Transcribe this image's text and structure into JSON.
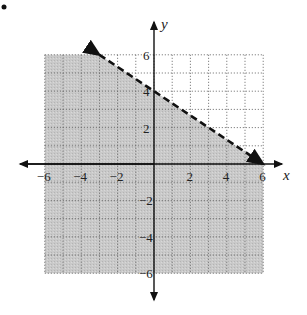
{
  "chart_data": {
    "type": "area",
    "title": "",
    "xlabel": "x",
    "ylabel": "y",
    "xlim": [
      -6,
      6
    ],
    "ylim": [
      -6,
      6
    ],
    "grid": true,
    "grid_style": "dotted",
    "x_ticks": [
      -6,
      -4,
      -2,
      2,
      4,
      6
    ],
    "y_ticks": [
      6,
      4,
      2,
      -2,
      -4,
      -6
    ],
    "x_tick_labels": [
      "-6",
      "-4",
      "-2",
      "2",
      "4",
      "6"
    ],
    "y_tick_labels": [
      "6",
      "4",
      "2",
      "-2",
      "-4",
      "-6"
    ],
    "boundary_line": {
      "style": "dashed",
      "points": [
        [
          -3,
          6
        ],
        [
          6,
          0
        ]
      ],
      "slope": -0.6667,
      "intercept": 4,
      "arrows": "both"
    },
    "shaded_region": "below",
    "inequality": "y < -2/3x + 4",
    "colors": {
      "shade": "#c8c8c8",
      "grid": "#555555",
      "line": "#111111",
      "axis": "#111111"
    }
  },
  "marker": "•"
}
